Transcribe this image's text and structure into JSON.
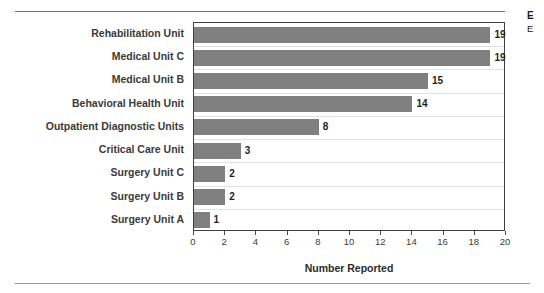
{
  "side_caption": {
    "title": "E",
    "subtitle": "E"
  },
  "chart_data": {
    "type": "bar",
    "orientation": "horizontal",
    "title": "",
    "subtitle": "",
    "xlabel": "Number Reported",
    "ylabel": "",
    "xlim": [
      0,
      20
    ],
    "xticks": [
      0,
      2,
      4,
      6,
      8,
      10,
      12,
      14,
      16,
      18,
      20
    ],
    "grid": true,
    "legend": "none",
    "bar_color": "#808080",
    "categories": [
      "Rehabilitation Unit",
      "Medical Unit C",
      "Medical Unit B",
      "Behavioral Health Unit",
      "Outpatient Diagnostic Units",
      "Critical Care Unit",
      "Surgery Unit C",
      "Surgery Unit B",
      "Surgery Unit A"
    ],
    "values": [
      19,
      19,
      15,
      14,
      8,
      3,
      2,
      2,
      1
    ],
    "data_labels": [
      "19",
      "19",
      "15",
      "14",
      "8",
      "3",
      "2",
      "2",
      "1"
    ]
  }
}
